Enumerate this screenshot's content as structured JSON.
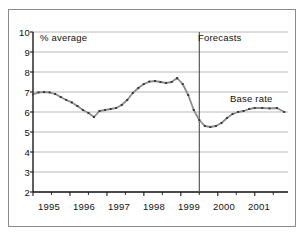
{
  "chart_data": {
    "type": "line",
    "title": "",
    "subtitle": "",
    "xlabel": "",
    "ylabel": "% average",
    "ylim": [
      2,
      10
    ],
    "xlim": [
      1995.0,
      2001.9
    ],
    "grid": true,
    "legend_position": "inline-annotation",
    "y_ticks": [
      "10",
      "9",
      "8",
      "7",
      "6",
      "5",
      "4",
      "3",
      "2"
    ],
    "y_tick_values": [
      10,
      9,
      8,
      7,
      6,
      5,
      4,
      3,
      2
    ],
    "x_ticks": [
      "1995",
      "1996",
      "1997",
      "1998",
      "1999",
      "2000",
      "2001"
    ],
    "x_tick_values": [
      1995,
      1996,
      1997,
      1998,
      1999,
      2000,
      2001
    ],
    "annotations": [
      {
        "name": "units-note",
        "text": "% average",
        "x": 1995.05,
        "y": 9.55
      },
      {
        "name": "forecasts-note",
        "text": "Forecasts",
        "x": 1999.65,
        "y": 9.55
      },
      {
        "name": "series-label",
        "text": "Base rate",
        "x": 2000.85,
        "y": 6.95
      }
    ],
    "divider": {
      "name": "forecast-divider",
      "x": 1999.5,
      "label": "Forecasts"
    },
    "series": [
      {
        "name": "Base rate",
        "color": "#8c8c8c",
        "marker_color": "#3a3a3a",
        "x": [
          1995.0,
          1995.15,
          1995.3,
          1995.45,
          1995.6,
          1995.75,
          1995.9,
          1996.05,
          1996.2,
          1996.35,
          1996.5,
          1996.65,
          1996.8,
          1996.95,
          1997.1,
          1997.25,
          1997.4,
          1997.55,
          1997.7,
          1997.85,
          1998.0,
          1998.15,
          1998.3,
          1998.45,
          1998.6,
          1998.75,
          1998.9,
          1999.05,
          1999.2,
          1999.35,
          1999.5,
          1999.65,
          1999.8,
          1999.95,
          2000.1,
          2000.25,
          2000.4,
          2000.55,
          2000.7,
          2000.85,
          2001.0,
          2001.2,
          2001.4,
          2001.6,
          2001.8
        ],
        "values": [
          6.88,
          6.98,
          7.0,
          6.98,
          6.9,
          6.75,
          6.6,
          6.48,
          6.3,
          6.1,
          5.95,
          5.75,
          6.05,
          6.1,
          6.15,
          6.2,
          6.35,
          6.6,
          6.95,
          7.2,
          7.4,
          7.52,
          7.55,
          7.5,
          7.45,
          7.5,
          7.7,
          7.4,
          6.85,
          6.1,
          5.6,
          5.3,
          5.25,
          5.3,
          5.45,
          5.7,
          5.9,
          6.0,
          6.05,
          6.15,
          6.2,
          6.2,
          6.18,
          6.2,
          6.0
        ]
      }
    ]
  }
}
